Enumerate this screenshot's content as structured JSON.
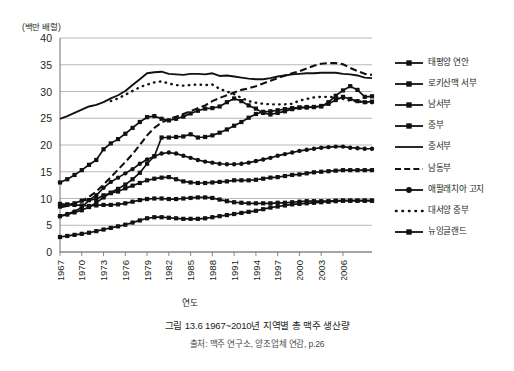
{
  "axis": {
    "y_unit_label": "(백만 배럴)",
    "x_title": "연도"
  },
  "caption": {
    "main": "그림 13.6 1967~2010년 지역별 총 맥주 생산량",
    "source": "출처: 맥주 연구소, 양조업체 연감, p.26"
  },
  "legend": {
    "items": [
      {
        "label": "태평양 연안",
        "style": "line-square"
      },
      {
        "label": "로키산맥 서부",
        "style": "line-square"
      },
      {
        "label": "남서부",
        "style": "line-square"
      },
      {
        "label": "중부",
        "style": "line-square"
      },
      {
        "label": "중서부",
        "style": "line-plain"
      },
      {
        "label": "남동부",
        "style": "dashed"
      },
      {
        "label": "애팔래치아 고지",
        "style": "line-circle"
      },
      {
        "label": "대서양 중부",
        "style": "dotted"
      },
      {
        "label": "뉴잉글랜드",
        "style": "line-square"
      }
    ]
  },
  "chart_data": {
    "type": "line",
    "title": "그림 13.6 1967~2010년 지역별 총 맥주 생산량",
    "xlabel": "연도",
    "ylabel": "(백만 배럴)",
    "ylim": [
      0,
      40
    ],
    "ytick_step": 5,
    "yticks": [
      0,
      5,
      10,
      15,
      20,
      25,
      30,
      35,
      40
    ],
    "grid": true,
    "legend_position": "right",
    "xlim": [
      1967,
      2010
    ],
    "xtick_labels": [
      "1967",
      "1970",
      "1973",
      "1976",
      "1979",
      "1982",
      "1985",
      "1988",
      "1991",
      "1994",
      "1997",
      "2000",
      "2003",
      "2006"
    ],
    "x": [
      1967,
      1968,
      1969,
      1970,
      1971,
      1972,
      1973,
      1974,
      1975,
      1976,
      1977,
      1978,
      1979,
      1980,
      1981,
      1982,
      1983,
      1984,
      1985,
      1986,
      1987,
      1988,
      1989,
      1990,
      1991,
      1992,
      1993,
      1994,
      1995,
      1996,
      1997,
      1998,
      1999,
      2000,
      2001,
      2002,
      2003,
      2004,
      2005,
      2006,
      2007,
      2008,
      2009,
      2010
    ],
    "series": [
      {
        "name": "중서부",
        "style": "line-plain",
        "values": [
          24.9,
          25.4,
          26.0,
          26.6,
          27.2,
          27.5,
          28.0,
          28.7,
          29.3,
          30.1,
          31.2,
          32.3,
          33.4,
          33.6,
          33.7,
          33.3,
          33.2,
          33.1,
          33.3,
          33.3,
          33.2,
          33.4,
          32.9,
          33.0,
          32.8,
          32.6,
          32.4,
          32.3,
          32.3,
          32.5,
          32.8,
          33.0,
          33.2,
          33.3,
          33.4,
          33.4,
          33.5,
          33.5,
          33.5,
          33.3,
          33.2,
          33.0,
          32.6,
          32.5
        ]
      },
      {
        "name": "대서양 중부",
        "style": "dotted",
        "values": [
          null,
          null,
          null,
          null,
          null,
          null,
          null,
          28.2,
          28.7,
          29.4,
          30.1,
          30.8,
          31.3,
          31.7,
          31.9,
          31.5,
          31.2,
          31.1,
          31.2,
          31.3,
          31.2,
          31.3,
          30.5,
          30.0,
          29.5,
          28.8,
          28.2,
          27.9,
          27.7,
          27.6,
          27.6,
          27.6,
          27.7,
          28.3,
          28.6,
          28.9,
          29.0,
          29.0,
          28.9,
          28.6,
          28.3,
          28.2,
          27.9,
          27.8
        ]
      },
      {
        "name": "남동부",
        "style": "dashed",
        "values": [
          8.3,
          8.6,
          9.0,
          9.5,
          10.3,
          11.3,
          12.6,
          14.0,
          15.4,
          16.8,
          18.3,
          20.0,
          21.8,
          23.2,
          24.2,
          24.8,
          25.3,
          25.8,
          26.3,
          26.9,
          27.4,
          28.2,
          28.8,
          29.3,
          29.8,
          30.3,
          30.6,
          31.0,
          31.5,
          32.0,
          32.5,
          33.0,
          33.4,
          33.8,
          34.3,
          34.8,
          35.2,
          35.3,
          35.3,
          35.1,
          34.4,
          33.8,
          33.3,
          33.1
        ]
      },
      {
        "name": "태평양 연안",
        "style": "line-square",
        "values": [
          13.0,
          13.6,
          14.4,
          15.3,
          16.3,
          17.2,
          19.2,
          20.3,
          21.1,
          22.1,
          23.2,
          24.3,
          25.2,
          25.4,
          24.9,
          24.6,
          24.9,
          25.3,
          25.9,
          26.4,
          26.8,
          26.9,
          27.2,
          28.0,
          28.7,
          28.2,
          27.4,
          26.8,
          26.0,
          25.7,
          26.0,
          26.3,
          26.7,
          27.0,
          27.1,
          27.1,
          27.2,
          28.0,
          29.2,
          30.2,
          31.0,
          30.3,
          29.0,
          29.1
        ]
      },
      {
        "name": "로키산맥 서부",
        "style": "line-square",
        "values": [
          6.7,
          7.0,
          7.4,
          7.8,
          8.4,
          9.2,
          10.2,
          11.1,
          11.8,
          12.6,
          13.6,
          14.8,
          16.5,
          17.9,
          21.4,
          21.4,
          21.5,
          21.6,
          22.0,
          21.4,
          21.5,
          21.8,
          22.3,
          22.9,
          23.6,
          24.3,
          25.1,
          25.8,
          26.2,
          26.3,
          26.5,
          26.7,
          26.9,
          27.0,
          27.0,
          27.1,
          27.3,
          27.7,
          28.4,
          29.0,
          28.6,
          28.2,
          28.0,
          28.1
        ]
      },
      {
        "name": "남서부",
        "style": "line-square",
        "values": [
          8.5,
          8.8,
          9.1,
          9.6,
          9.7,
          9.9,
          10.6,
          11.0,
          11.3,
          11.9,
          12.4,
          12.9,
          13.4,
          13.7,
          13.9,
          14.0,
          13.6,
          13.2,
          13.0,
          12.9,
          12.9,
          13.0,
          13.1,
          13.2,
          13.4,
          13.4,
          13.4,
          13.5,
          13.7,
          13.9,
          14.0,
          14.2,
          14.4,
          14.5,
          14.7,
          14.9,
          15.0,
          15.1,
          15.2,
          15.3,
          15.3,
          15.3,
          15.3,
          15.3
        ]
      },
      {
        "name": "애팔래치아 고지",
        "style": "line-circle",
        "values": [
          6.7,
          7.1,
          7.6,
          8.3,
          9.7,
          10.6,
          12.0,
          13.1,
          13.9,
          14.7,
          15.5,
          16.5,
          17.3,
          17.9,
          18.4,
          18.6,
          18.4,
          18.0,
          17.6,
          17.2,
          16.9,
          16.7,
          16.5,
          16.4,
          16.4,
          16.5,
          16.7,
          17.0,
          17.3,
          17.6,
          18.0,
          18.3,
          18.6,
          18.9,
          19.1,
          19.3,
          19.5,
          19.6,
          19.7,
          19.7,
          19.5,
          19.4,
          19.3,
          19.3
        ]
      },
      {
        "name": "중부",
        "style": "line-square",
        "values": [
          9.0,
          8.9,
          8.8,
          8.7,
          8.6,
          8.7,
          8.8,
          8.8,
          8.9,
          9.1,
          9.4,
          9.7,
          9.9,
          10.0,
          10.0,
          9.9,
          9.9,
          10.0,
          10.1,
          10.2,
          10.2,
          10.1,
          9.8,
          9.5,
          9.3,
          9.2,
          9.1,
          9.1,
          9.1,
          9.1,
          9.2,
          9.2,
          9.3,
          9.4,
          9.5,
          9.5,
          9.5,
          9.5,
          9.6,
          9.6,
          9.6,
          9.6,
          9.6,
          9.6
        ]
      },
      {
        "name": "뉴잉글랜드",
        "style": "line-square",
        "values": [
          2.8,
          3.0,
          3.2,
          3.4,
          3.6,
          3.9,
          4.2,
          4.5,
          4.8,
          5.1,
          5.5,
          5.9,
          6.3,
          6.5,
          6.5,
          6.4,
          6.3,
          6.2,
          6.2,
          6.2,
          6.3,
          6.5,
          6.7,
          6.9,
          7.1,
          7.3,
          7.5,
          7.7,
          8.0,
          8.3,
          8.5,
          8.7,
          8.9,
          9.0,
          9.1,
          9.2,
          9.3,
          9.4,
          9.5,
          9.6,
          9.6,
          9.6,
          9.6,
          9.6
        ]
      }
    ]
  }
}
